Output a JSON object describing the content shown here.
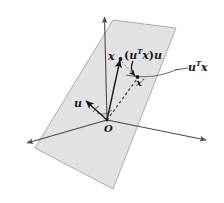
{
  "figure": {
    "background_color": "#ffffff",
    "plane": {
      "name": "shaded-plane",
      "fill_color": "#e2e2e2",
      "stroke_color": "#8a8a8a"
    },
    "axes": {
      "stroke_color": "#4a4a4a",
      "vertical_label": "",
      "left_label": "",
      "right_label": ""
    },
    "vectors": {
      "x_vector": {
        "style": "solid",
        "color": "#1a1a1a"
      },
      "x_prime_vector": {
        "style": "dashed",
        "color": "#4a4a4a"
      },
      "u_vector": {
        "style": "solid",
        "color": "#1a1a1a"
      }
    },
    "labels": {
      "x": "x",
      "projection_open": "(",
      "projection_u": "u",
      "projection_T": "T",
      "projection_x": "x",
      "projection_close": ")",
      "projection_tail": "u",
      "x_prime": "x",
      "x_prime_mark": "′",
      "utx_u": "u",
      "utx_T": "T",
      "utx_x": "x",
      "u": "u",
      "origin": "O"
    }
  }
}
